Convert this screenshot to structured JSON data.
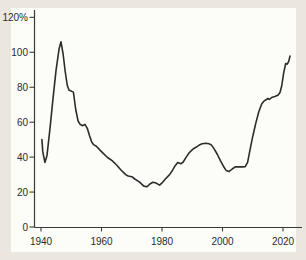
{
  "colors": {
    "background": "#ebe7de",
    "panel": "#fcfcf9",
    "line": "#2c2c2c",
    "axis": "#3a3a3a",
    "text": "#2b2b2b"
  },
  "chart_data": {
    "type": "line",
    "title": "",
    "xlabel": "",
    "ylabel": "",
    "grid": false,
    "legend": false,
    "xlim": [
      1937.8,
      2026
    ],
    "ylim": [
      0,
      124
    ],
    "x_ticks": [
      {
        "value": 1940,
        "label": "1940"
      },
      {
        "value": 1960,
        "label": "1960"
      },
      {
        "value": 1980,
        "label": "1980"
      },
      {
        "value": 2000,
        "label": "2000"
      },
      {
        "value": 2020,
        "label": "2020"
      }
    ],
    "y_ticks": [
      {
        "value": 0,
        "label": "0"
      },
      {
        "value": 20,
        "label": "20"
      },
      {
        "value": 40,
        "label": "40"
      },
      {
        "value": 60,
        "label": "60"
      },
      {
        "value": 80,
        "label": "80"
      },
      {
        "value": 100,
        "label": "100"
      },
      {
        "value": 120,
        "label": "120%"
      }
    ],
    "series": [
      {
        "name": "percent-of-gdp-line",
        "points": [
          [
            1940.3,
            50
          ],
          [
            1940.6,
            43
          ],
          [
            1941.3,
            37
          ],
          [
            1942,
            41
          ],
          [
            1943,
            57
          ],
          [
            1944,
            74
          ],
          [
            1945,
            90
          ],
          [
            1946,
            102
          ],
          [
            1946.6,
            106
          ],
          [
            1947.3,
            99
          ],
          [
            1948,
            89
          ],
          [
            1948.7,
            81
          ],
          [
            1949.3,
            78.3
          ],
          [
            1950,
            77.8
          ],
          [
            1950.7,
            77.2
          ],
          [
            1951.5,
            67
          ],
          [
            1952.3,
            60.5
          ],
          [
            1953,
            58.6
          ],
          [
            1953.8,
            58
          ],
          [
            1954.5,
            58.8
          ],
          [
            1955.3,
            56.5
          ],
          [
            1956,
            52.5
          ],
          [
            1956.8,
            48.5
          ],
          [
            1957.5,
            47
          ],
          [
            1958.3,
            46.2
          ],
          [
            1959.5,
            44
          ],
          [
            1960.5,
            42.3
          ],
          [
            1962,
            39.8
          ],
          [
            1963.5,
            38
          ],
          [
            1965,
            35.5
          ],
          [
            1966.5,
            32.5
          ],
          [
            1968,
            30
          ],
          [
            1968.8,
            29.2
          ],
          [
            1970,
            28.8
          ],
          [
            1971,
            27.5
          ],
          [
            1972.5,
            25.8
          ],
          [
            1974,
            23.4
          ],
          [
            1975,
            23
          ],
          [
            1976,
            24.6
          ],
          [
            1977,
            25.6
          ],
          [
            1978,
            25.2
          ],
          [
            1979.2,
            24
          ],
          [
            1980.2,
            25.6
          ],
          [
            1981.2,
            27.6
          ],
          [
            1982.5,
            30
          ],
          [
            1983.5,
            32.5
          ],
          [
            1984.3,
            35
          ],
          [
            1985.2,
            37
          ],
          [
            1986.2,
            36.2
          ],
          [
            1987,
            37.2
          ],
          [
            1988,
            40
          ],
          [
            1989,
            42.5
          ],
          [
            1990.2,
            44.6
          ],
          [
            1991.2,
            45.6
          ],
          [
            1992.3,
            46.9
          ],
          [
            1993.3,
            47.6
          ],
          [
            1994.5,
            47.9
          ],
          [
            1995.5,
            47.7
          ],
          [
            1996.3,
            47
          ],
          [
            1997.3,
            44.6
          ],
          [
            1998.3,
            41.5
          ],
          [
            1999.3,
            38
          ],
          [
            2000.3,
            34.8
          ],
          [
            2001.2,
            32.4
          ],
          [
            2002.2,
            31.8
          ],
          [
            2003.2,
            33.2
          ],
          [
            2004.2,
            34.4
          ],
          [
            2005.5,
            34.5
          ],
          [
            2006.5,
            34.4
          ],
          [
            2007.5,
            34.6
          ],
          [
            2008.3,
            37
          ],
          [
            2009.2,
            45
          ],
          [
            2010,
            52
          ],
          [
            2011,
            59.5
          ],
          [
            2012,
            66
          ],
          [
            2013,
            70.5
          ],
          [
            2013.7,
            72
          ],
          [
            2014.5,
            73
          ],
          [
            2015,
            73.6
          ],
          [
            2015.5,
            73
          ],
          [
            2016.3,
            74.2
          ],
          [
            2017.3,
            74.7
          ],
          [
            2018.3,
            75.4
          ],
          [
            2019,
            77
          ],
          [
            2019.6,
            81
          ],
          [
            2020.2,
            88
          ],
          [
            2020.9,
            93.6
          ],
          [
            2021.4,
            93.2
          ],
          [
            2021.9,
            94.8
          ],
          [
            2022.3,
            97.8
          ]
        ]
      }
    ]
  }
}
